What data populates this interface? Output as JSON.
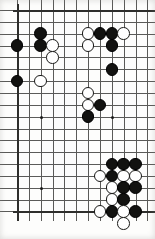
{
  "app": {
    "title": "Go Board Diagram",
    "description": "Scanned go (weiqi/baduk) board position, partial board view"
  },
  "board": {
    "style": "scanned-print",
    "columns": 12,
    "rows": 18,
    "cell_size_px": 11.85,
    "origin_x_px": 17,
    "origin_y_px": 10,
    "line_color": "#5a5a58",
    "edge_color": "#2e2e2c",
    "background_color": "#fdfdfc",
    "black_stone_color": "#121210",
    "white_stone_color": "#ffffff",
    "stone_diameter_px": 12.6,
    "edges_drawn": [
      "top",
      "left",
      "bottom"
    ],
    "star_points": [
      {
        "col": 2,
        "row": 9
      },
      {
        "col": 8,
        "row": 9
      },
      {
        "col": 2,
        "row": 15
      }
    ],
    "stones": [
      {
        "color": "black",
        "col": 0,
        "row": 3
      },
      {
        "color": "black",
        "col": 0,
        "row": 6
      },
      {
        "color": "black",
        "col": 2,
        "row": 2
      },
      {
        "color": "black",
        "col": 2,
        "row": 3
      },
      {
        "color": "white",
        "col": 3,
        "row": 3
      },
      {
        "color": "white",
        "col": 3,
        "row": 4
      },
      {
        "color": "white",
        "col": 2,
        "row": 6
      },
      {
        "color": "white",
        "col": 6,
        "row": 2
      },
      {
        "color": "black",
        "col": 7,
        "row": 2
      },
      {
        "color": "black",
        "col": 8,
        "row": 2
      },
      {
        "color": "white",
        "col": 9,
        "row": 2
      },
      {
        "color": "white",
        "col": 6,
        "row": 3
      },
      {
        "color": "black",
        "col": 8,
        "row": 3
      },
      {
        "color": "black",
        "col": 8,
        "row": 5
      },
      {
        "color": "white",
        "col": 6,
        "row": 7
      },
      {
        "color": "white",
        "col": 6,
        "row": 8
      },
      {
        "color": "black",
        "col": 7,
        "row": 8
      },
      {
        "color": "black",
        "col": 6,
        "row": 9
      },
      {
        "color": "black",
        "col": 8,
        "row": 13
      },
      {
        "color": "black",
        "col": 9,
        "row": 13
      },
      {
        "color": "black",
        "col": 10,
        "row": 13
      },
      {
        "color": "white",
        "col": 7,
        "row": 14
      },
      {
        "color": "black",
        "col": 8,
        "row": 14
      },
      {
        "color": "white",
        "col": 9,
        "row": 14
      },
      {
        "color": "white",
        "col": 10,
        "row": 14
      },
      {
        "color": "white",
        "col": 8,
        "row": 15
      },
      {
        "color": "black",
        "col": 9,
        "row": 15
      },
      {
        "color": "black",
        "col": 10,
        "row": 15
      },
      {
        "color": "white",
        "col": 8,
        "row": 16
      },
      {
        "color": "black",
        "col": 9,
        "row": 16
      },
      {
        "color": "white",
        "col": 7,
        "row": 17
      },
      {
        "color": "black",
        "col": 8,
        "row": 17
      },
      {
        "color": "white",
        "col": 9,
        "row": 17
      },
      {
        "color": "black",
        "col": 10,
        "row": 17
      },
      {
        "color": "white",
        "col": 9,
        "row": 18
      }
    ]
  }
}
